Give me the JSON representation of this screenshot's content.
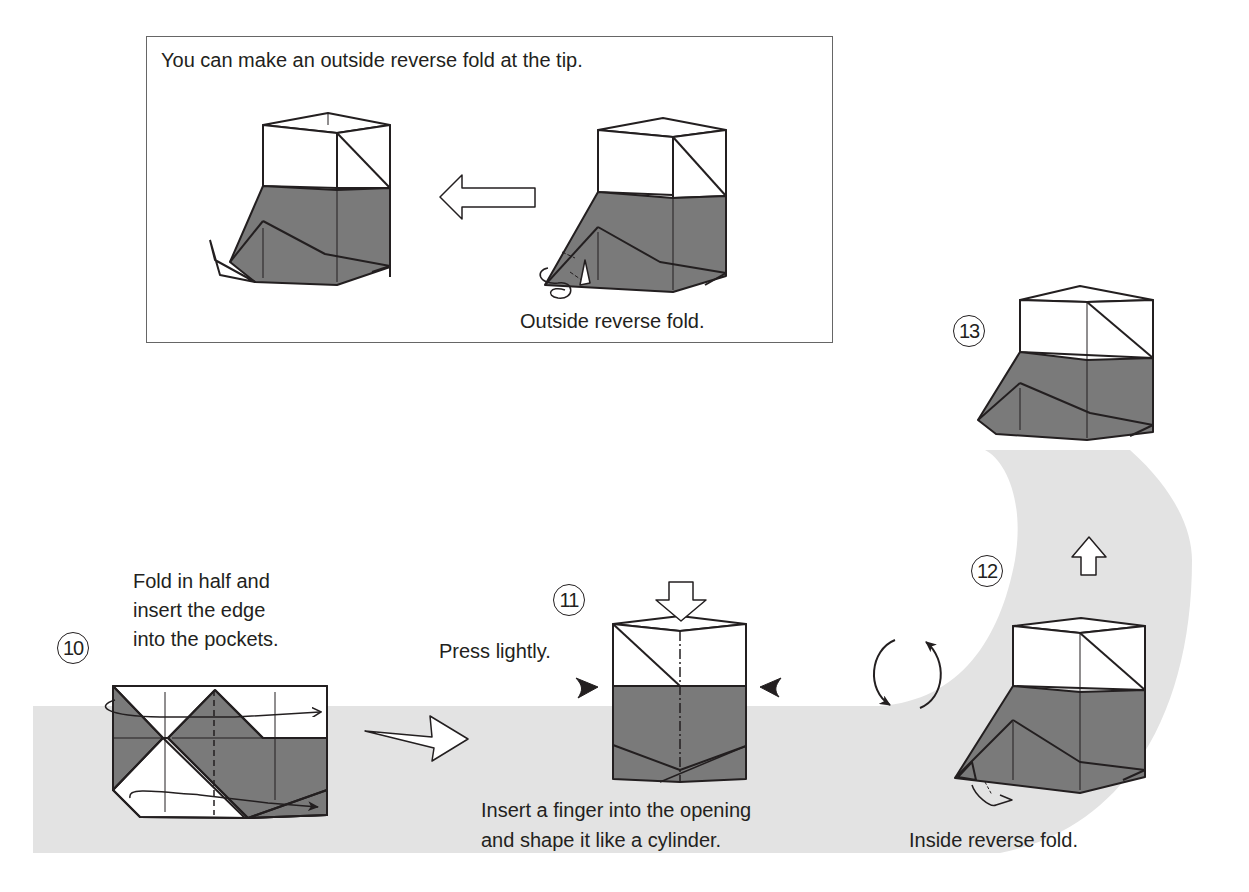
{
  "inset": {
    "title": "You can make an outside reverse fold at the tip.",
    "caption": "Outside reverse fold."
  },
  "steps": [
    {
      "number": "10",
      "instruction_lines": [
        "Fold in half and",
        "insert the edge",
        "into the pockets."
      ]
    },
    {
      "number": "11",
      "note": "Press lightly.",
      "instruction_lines": [
        "Insert a finger into the opening",
        "and shape it like a cylinder."
      ]
    },
    {
      "number": "12",
      "caption": "Inside reverse fold."
    },
    {
      "number": "13"
    }
  ],
  "colors": {
    "paper_colored": "#7a7a7a",
    "paper_white": "#ffffff",
    "background_band": "#e3e3e3",
    "line": "#231f20"
  },
  "icons": [
    "arrow-left-icon",
    "arrow-right-icon",
    "arrow-down-icon",
    "arrow-up-icon",
    "rotate-over-icon",
    "push-arrow-icon",
    "fold-arrow-icon"
  ]
}
